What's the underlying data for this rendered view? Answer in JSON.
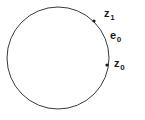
{
  "figure": {
    "background_color": "#ffffff",
    "stroke_color": "#3a3a3a",
    "text_color": "#1a1a1a",
    "circle": {
      "center_x": 58,
      "center_y": 58,
      "radius": 51,
      "stroke_width": 1
    },
    "points": [
      {
        "id": "z1",
        "label_base": "z",
        "label_sub": "1",
        "x": 94,
        "y": 21,
        "marker_radius": 1.6
      },
      {
        "id": "z0",
        "label_base": "z",
        "label_sub": "0",
        "x": 107,
        "y": 65,
        "marker_radius": 1.6
      }
    ],
    "annotations": [
      {
        "id": "e0",
        "label_base": "e",
        "label_sub": "0",
        "x": 112,
        "y": 35
      }
    ]
  }
}
